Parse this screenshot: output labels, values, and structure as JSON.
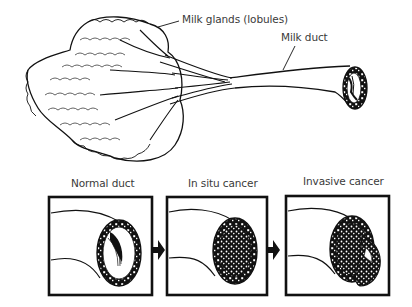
{
  "top_figure": {
    "labels": {
      "lobules": "Milk glands (lobules)",
      "duct": "Milk duct"
    }
  },
  "panels": [
    {
      "title": "Normal duct",
      "state": "normal"
    },
    {
      "title": "In situ cancer",
      "state": "in-situ"
    },
    {
      "title": "Invasive cancer",
      "state": "invasive"
    }
  ],
  "arrows": [
    "right-arrow",
    "right-arrow"
  ],
  "colors": {
    "ink": "#111111",
    "label": "#3a3a3a",
    "background": "#ffffff"
  }
}
